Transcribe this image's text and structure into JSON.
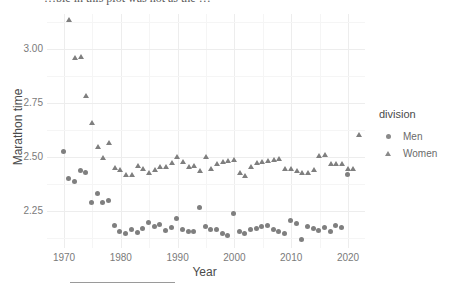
{
  "top_text": "…ble in this plot was not as the …",
  "chart_data": {
    "type": "scatter",
    "title": "",
    "xlabel": "Year",
    "ylabel": "Marathon time",
    "xlim": [
      1967,
      2023
    ],
    "ylim": [
      2.08,
      3.16
    ],
    "xticks": [
      1970,
      1980,
      1990,
      2000,
      2010,
      2020
    ],
    "xticklabels": [
      "1970",
      "1980",
      "1990",
      "2000",
      "2010",
      "2020"
    ],
    "yticks": [
      2.25,
      2.5,
      2.75,
      3.0
    ],
    "yticklabels": [
      "2.25",
      "2.50",
      "2.75",
      "3.00"
    ],
    "grid": true,
    "legend": {
      "title": "division",
      "position": "right",
      "entries": [
        {
          "label": "Men",
          "marker": "circle",
          "color": "#7f7f7f"
        },
        {
          "label": "Women",
          "marker": "triangle",
          "color": "#7f7f7f"
        }
      ]
    },
    "marker_color": "#7f7f7f",
    "series": [
      {
        "name": "Men",
        "marker": "circle",
        "points": [
          [
            1970,
            2.525
          ],
          [
            1971,
            2.4
          ],
          [
            1972,
            2.385
          ],
          [
            1973,
            2.44
          ],
          [
            1974,
            2.43
          ],
          [
            1975,
            2.29
          ],
          [
            1976,
            2.33
          ],
          [
            1977,
            2.29
          ],
          [
            1978,
            2.3
          ],
          [
            1979,
            2.185
          ],
          [
            1980,
            2.155
          ],
          [
            1981,
            2.145
          ],
          [
            1982,
            2.165
          ],
          [
            1983,
            2.15
          ],
          [
            1984,
            2.17
          ],
          [
            1985,
            2.2
          ],
          [
            1986,
            2.18
          ],
          [
            1987,
            2.19
          ],
          [
            1988,
            2.16
          ],
          [
            1989,
            2.175
          ],
          [
            1990,
            2.215
          ],
          [
            1991,
            2.165
          ],
          [
            1992,
            2.155
          ],
          [
            1993,
            2.155
          ],
          [
            1994,
            2.265
          ],
          [
            1995,
            2.18
          ],
          [
            1996,
            2.165
          ],
          [
            1997,
            2.165
          ],
          [
            1998,
            2.145
          ],
          [
            1999,
            2.14
          ],
          [
            2000,
            2.24
          ],
          [
            2001,
            2.155
          ],
          [
            2002,
            2.145
          ],
          [
            2003,
            2.165
          ],
          [
            2004,
            2.17
          ],
          [
            2005,
            2.18
          ],
          [
            2006,
            2.185
          ],
          [
            2007,
            2.165
          ],
          [
            2008,
            2.155
          ],
          [
            2009,
            2.145
          ],
          [
            2010,
            2.205
          ],
          [
            2011,
            2.195
          ],
          [
            2012,
            2.12
          ],
          [
            2013,
            2.18
          ],
          [
            2014,
            2.17
          ],
          [
            2015,
            2.16
          ],
          [
            2016,
            2.175
          ],
          [
            2017,
            2.155
          ],
          [
            2018,
            2.185
          ],
          [
            2019,
            2.175
          ],
          [
            2020,
            2.42
          ]
        ]
      },
      {
        "name": "Women",
        "marker": "triangle",
        "points": [
          [
            1971,
            3.13
          ],
          [
            1972,
            2.955
          ],
          [
            1973,
            2.96
          ],
          [
            1974,
            2.78
          ],
          [
            1975,
            2.655
          ],
          [
            1976,
            2.545
          ],
          [
            1977,
            2.495
          ],
          [
            1978,
            2.565
          ],
          [
            1979,
            2.45
          ],
          [
            1980,
            2.44
          ],
          [
            1981,
            2.415
          ],
          [
            1982,
            2.415
          ],
          [
            1983,
            2.46
          ],
          [
            1984,
            2.445
          ],
          [
            1985,
            2.425
          ],
          [
            1986,
            2.44
          ],
          [
            1987,
            2.455
          ],
          [
            1988,
            2.455
          ],
          [
            1989,
            2.47
          ],
          [
            1990,
            2.5
          ],
          [
            1991,
            2.475
          ],
          [
            1992,
            2.455
          ],
          [
            1993,
            2.46
          ],
          [
            1994,
            2.435
          ],
          [
            1995,
            2.5
          ],
          [
            1996,
            2.445
          ],
          [
            1997,
            2.465
          ],
          [
            1998,
            2.475
          ],
          [
            1999,
            2.48
          ],
          [
            2000,
            2.485
          ],
          [
            2001,
            2.425
          ],
          [
            2002,
            2.41
          ],
          [
            2003,
            2.455
          ],
          [
            2004,
            2.47
          ],
          [
            2005,
            2.475
          ],
          [
            2006,
            2.48
          ],
          [
            2007,
            2.485
          ],
          [
            2008,
            2.49
          ],
          [
            2009,
            2.445
          ],
          [
            2010,
            2.445
          ],
          [
            2011,
            2.435
          ],
          [
            2012,
            2.425
          ],
          [
            2013,
            2.425
          ],
          [
            2014,
            2.44
          ],
          [
            2015,
            2.505
          ],
          [
            2016,
            2.51
          ],
          [
            2017,
            2.465
          ],
          [
            2018,
            2.465
          ],
          [
            2019,
            2.465
          ],
          [
            2020,
            2.445
          ],
          [
            2021,
            2.445
          ],
          [
            2022,
            2.6
          ]
        ]
      }
    ]
  }
}
